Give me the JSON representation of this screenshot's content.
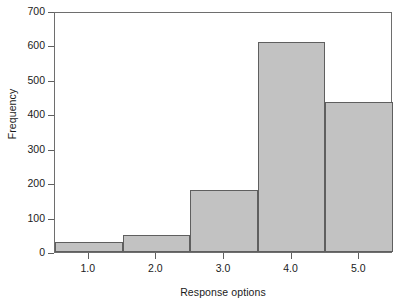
{
  "chart_data": {
    "type": "bar",
    "title": "",
    "xlabel": "Response options",
    "ylabel": "Frequency",
    "categories": [
      "1.0",
      "2.0",
      "3.0",
      "4.0",
      "5.0"
    ],
    "values": [
      30,
      50,
      180,
      610,
      435
    ],
    "bin_edges": [
      0.5,
      1.5,
      2.5,
      3.5,
      4.5,
      5.5
    ],
    "xlim": [
      0.5,
      5.5
    ],
    "ylim": [
      0,
      700
    ],
    "ytick_labels": [
      "0",
      "100",
      "200",
      "300",
      "400",
      "500",
      "600",
      "700"
    ],
    "ytick_values": [
      0,
      100,
      200,
      300,
      400,
      500,
      600,
      700
    ],
    "xtick_labels": [
      "1.0",
      "2.0",
      "3.0",
      "4.0",
      "5.0"
    ],
    "xtick_values": [
      1.0,
      2.0,
      3.0,
      4.0,
      5.0
    ],
    "grid": false,
    "legend": null,
    "bar_fill_color": "#c2c2c2",
    "bar_edge_color": "#5f5f5f",
    "axis_color": "#6e6e6e",
    "text_color": "#1b1b1b",
    "background_color": "#ffffff"
  }
}
